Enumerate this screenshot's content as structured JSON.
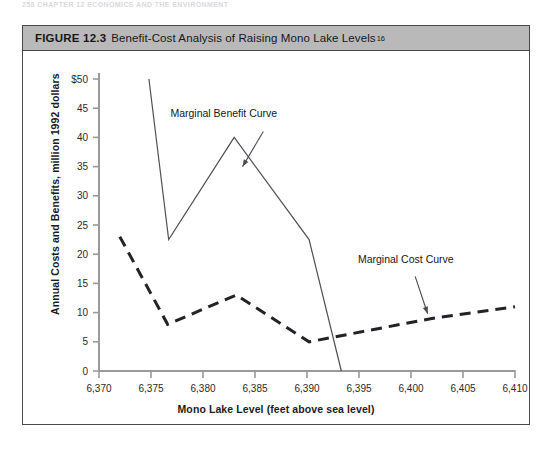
{
  "page_header": "258   CHAPTER 12  ECONOMICS AND THE ENVIRONMENT",
  "figure": {
    "label": "FIGURE 12.3",
    "caption": "Benefit-Cost Analysis of Raising Mono Lake Levels",
    "footnote_marker": "16"
  },
  "chart_data": {
    "type": "line",
    "title": "Benefit-Cost Analysis of Raising Mono Lake Levels",
    "xlabel": "Mono Lake Level (feet above sea level)",
    "ylabel": "Annual Costs and Benefits, million 1992 dollars",
    "xlim": [
      6370,
      6410
    ],
    "ylim": [
      0,
      50
    ],
    "x_ticks": [
      6370,
      6375,
      6380,
      6385,
      6390,
      6395,
      6400,
      6405,
      6410
    ],
    "x_tick_labels": [
      "6,370",
      "6,375",
      "6,380",
      "6,385",
      "6,390",
      "6,395",
      "6,400",
      "6,405",
      "6,410"
    ],
    "y_ticks": [
      0,
      5,
      10,
      15,
      20,
      25,
      30,
      35,
      40,
      45,
      50
    ],
    "y_tick_labels": [
      "0",
      "5",
      "10",
      "15",
      "20",
      "25",
      "30",
      "35",
      "40",
      "45",
      "$50"
    ],
    "grid": false,
    "legend": "none",
    "series": [
      {
        "name": "Marginal Benefit Curve",
        "style": "solid",
        "color": "#4f4f55",
        "points": [
          [
            6374.8,
            50.0
          ],
          [
            6376.7,
            22.5
          ],
          [
            6383.0,
            40.0
          ],
          [
            6390.2,
            22.5
          ],
          [
            6393.3,
            0.0
          ]
        ]
      },
      {
        "name": "Marginal Cost Curve",
        "style": "dashed",
        "color": "#222228",
        "points": [
          [
            6372.0,
            23.0
          ],
          [
            6376.6,
            8.0
          ],
          [
            6383.2,
            13.0
          ],
          [
            6390.2,
            5.0
          ],
          [
            6402.0,
            9.0
          ],
          [
            6410.0,
            11.0
          ]
        ]
      }
    ],
    "annotations": [
      {
        "text": "Marginal Benefit Curve",
        "text_x": 6382.0,
        "text_y": 43.5,
        "arrow_from_x": 6385.8,
        "arrow_from_y": 41.0,
        "arrow_to_x": 6383.8,
        "arrow_to_y": 35.0
      },
      {
        "text": "Marginal Cost Curve",
        "text_x": 6399.5,
        "text_y": 18.5,
        "arrow_from_x": 6400.4,
        "arrow_from_y": 16.2,
        "arrow_to_x": 6401.6,
        "arrow_to_y": 9.8
      }
    ]
  }
}
